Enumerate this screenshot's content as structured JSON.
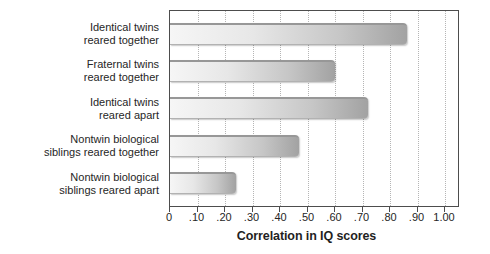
{
  "chart_data": {
    "type": "bar",
    "orientation": "horizontal",
    "title": "",
    "xlabel": "Correlation in IQ scores",
    "ylabel": "",
    "categories": [
      "Identical twins reared together",
      "Fraternal twins reared together",
      "Identical twins reared apart",
      "Nontwin biological siblings reared together",
      "Nontwin biological siblings reared apart"
    ],
    "category_label_lines": [
      [
        "Identical twins",
        "reared together"
      ],
      [
        "Fraternal twins",
        "reared together"
      ],
      [
        "Identical twins",
        "reared apart"
      ],
      [
        "Nontwin biological",
        "siblings reared together"
      ],
      [
        "Nontwin biological",
        "siblings reared apart"
      ]
    ],
    "values": [
      0.86,
      0.6,
      0.72,
      0.47,
      0.24
    ],
    "xticks": [
      {
        "value": 0.0,
        "label": "0"
      },
      {
        "value": 0.1,
        "label": ".10"
      },
      {
        "value": 0.2,
        "label": ".20"
      },
      {
        "value": 0.3,
        "label": ".30"
      },
      {
        "value": 0.4,
        "label": ".40"
      },
      {
        "value": 0.5,
        "label": ".50"
      },
      {
        "value": 0.6,
        "label": ".60"
      },
      {
        "value": 0.7,
        "label": ".70"
      },
      {
        "value": 0.8,
        "label": ".80"
      },
      {
        "value": 0.9,
        "label": ".90"
      },
      {
        "value": 1.0,
        "label": "1.00"
      }
    ],
    "xlim": [
      0,
      1.055
    ],
    "grid": {
      "axis": "x",
      "style": "dotted",
      "color": "#b5b5b5"
    },
    "legend": "none",
    "colors": {
      "bar_gradient_light": "#f6f6f6",
      "bar_gradient_dark": "#a2a2a2",
      "bar_top_edge": "#979797",
      "plot_border": "#4d4d4d",
      "text": "#262626",
      "background": "#ffffff"
    }
  }
}
